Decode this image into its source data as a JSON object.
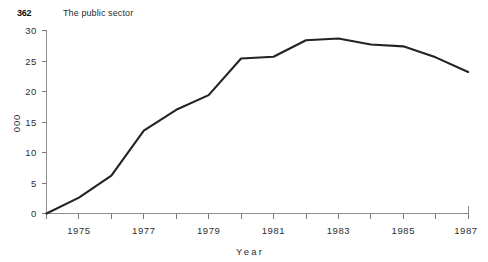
{
  "header": {
    "folio": "362",
    "title": "The public sector"
  },
  "chart_data": {
    "type": "line",
    "title": "",
    "xlabel": "Year",
    "ylabel": "000",
    "x": [
      1974,
      1975,
      1976,
      1977,
      1978,
      1979,
      1980,
      1981,
      1982,
      1983,
      1984,
      1985,
      1986,
      1987
    ],
    "values": [
      0,
      2.6,
      6.2,
      13.6,
      17.0,
      19.4,
      25.4,
      25.7,
      28.4,
      28.7,
      27.7,
      27.4,
      25.6,
      23.2
    ],
    "series": [
      {
        "name": "",
        "values": [
          0,
          2.6,
          6.2,
          13.6,
          17.0,
          19.4,
          25.4,
          25.7,
          28.4,
          28.7,
          27.7,
          27.4,
          25.6,
          23.2
        ]
      }
    ],
    "xlim": [
      1974,
      1987.4
    ],
    "ylim": [
      0,
      30
    ],
    "ytick_values": [
      0,
      5,
      10,
      15,
      20,
      25,
      30
    ],
    "ytick_labels": [
      "0",
      "5",
      "10",
      "15",
      "20",
      "25",
      "30"
    ],
    "xtick_values": [
      1974,
      1975,
      1976,
      1977,
      1978,
      1979,
      1980,
      1981,
      1982,
      1983,
      1984,
      1985,
      1986,
      1987
    ],
    "xtick_labels": [
      "",
      "1975",
      "",
      "1977",
      "",
      "1979",
      "",
      "1981",
      "",
      "1983",
      "",
      "1985",
      "",
      "1987"
    ],
    "grid": false,
    "legend": false,
    "line_color": "#232323",
    "axis_color": "#8d8d8d"
  }
}
